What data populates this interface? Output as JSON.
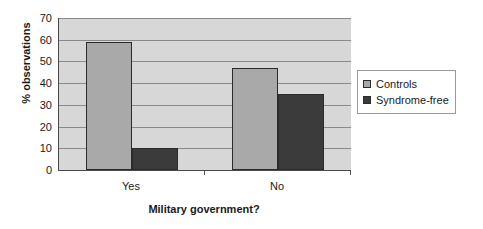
{
  "chart_data": {
    "type": "bar",
    "title": "",
    "xlabel": "Military government?",
    "ylabel": "% observations",
    "categories": [
      "Yes",
      "No"
    ],
    "series": [
      {
        "name": "Controls",
        "values": [
          59,
          47
        ],
        "color": "#a9a9a9"
      },
      {
        "name": "Syndrome-free",
        "values": [
          10,
          35
        ],
        "color": "#3b3b3b"
      }
    ],
    "ylim": [
      0,
      70
    ],
    "yticks": [
      0,
      10,
      20,
      30,
      40,
      50,
      60,
      70
    ],
    "ytick_labels": [
      "0",
      "10",
      "20",
      "30",
      "40",
      "50",
      "60",
      "70"
    ],
    "grid": true,
    "legend_position": "right",
    "plot_background": "#d7d7d7",
    "axis_color": "#4a4a4a",
    "gridline_color": "#8a8a8a"
  },
  "axes": {
    "y": {
      "label": "% observations",
      "ticks": [
        {
          "value": 70,
          "label": "70"
        },
        {
          "value": 60,
          "label": "60"
        },
        {
          "value": 50,
          "label": "50"
        },
        {
          "value": 40,
          "label": "40"
        },
        {
          "value": 30,
          "label": "30"
        },
        {
          "value": 20,
          "label": "20"
        },
        {
          "value": 10,
          "label": "10"
        },
        {
          "value": 0,
          "label": "0"
        }
      ]
    },
    "x": {
      "label": "Military government?",
      "ticks": [
        {
          "label": "Yes"
        },
        {
          "label": "No"
        }
      ]
    }
  },
  "legend": {
    "entries": [
      {
        "label": "Controls",
        "color": "#a9a9a9"
      },
      {
        "label": "Syndrome-free",
        "color": "#3b3b3b"
      }
    ]
  }
}
